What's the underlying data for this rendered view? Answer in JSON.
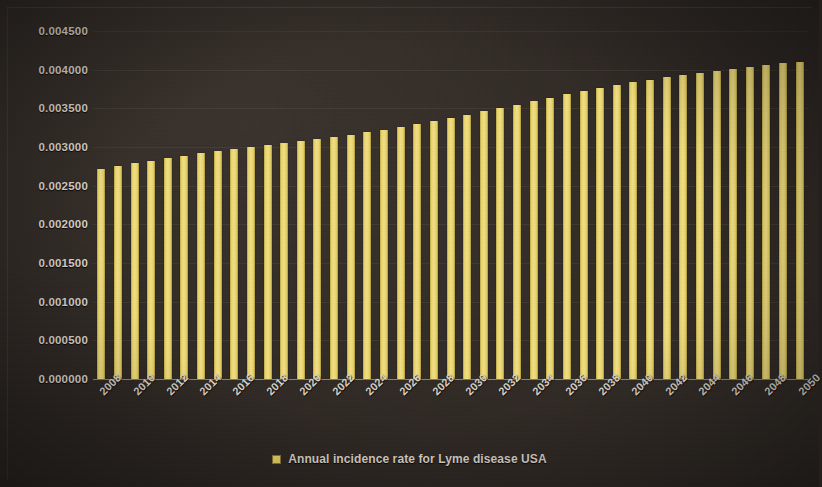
{
  "chart_data": {
    "type": "bar",
    "title": "",
    "subtitle": "",
    "xlabel": "",
    "ylabel": "",
    "grid": true,
    "legend_position": "bottom",
    "ylim": [
      0.0,
      0.0045
    ],
    "ytick_labels": [
      "0.004500",
      "0.004000",
      "0.003500",
      "0.003000",
      "0.002500",
      "0.002000",
      "0.001500",
      "0.001000",
      "0.000500",
      "0.000000"
    ],
    "ytick_values": [
      0.0045,
      0.004,
      0.0035,
      0.003,
      0.0025,
      0.002,
      0.0015,
      0.001,
      0.0005,
      0.0
    ],
    "xtick_labels": [
      "2008",
      "2010",
      "2012",
      "2014",
      "2016",
      "2018",
      "2020",
      "2022",
      "2024",
      "2026",
      "2028",
      "2030",
      "2032",
      "2034",
      "2036",
      "2038",
      "2040",
      "2042",
      "2044",
      "2046",
      "2048",
      "2050"
    ],
    "categories": [
      "2008",
      "2009",
      "2010",
      "2011",
      "2012",
      "2013",
      "2014",
      "2015",
      "2016",
      "2017",
      "2018",
      "2019",
      "2020",
      "2021",
      "2022",
      "2023",
      "2024",
      "2025",
      "2026",
      "2027",
      "2028",
      "2029",
      "2030",
      "2031",
      "2032",
      "2033",
      "2034",
      "2035",
      "2036",
      "2037",
      "2038",
      "2039",
      "2040",
      "2041",
      "2042",
      "2043",
      "2044",
      "2045",
      "2046",
      "2047",
      "2048",
      "2049",
      "2050"
    ],
    "series": [
      {
        "name": "Annual incidence rate for Lyme disease USA",
        "color": "#e9d566",
        "values": [
          0.00272,
          0.002755,
          0.00279,
          0.002825,
          0.00286,
          0.00289,
          0.00292,
          0.00295,
          0.00298,
          0.003005,
          0.00303,
          0.003055,
          0.00308,
          0.003105,
          0.00313,
          0.00316,
          0.00319,
          0.003225,
          0.00326,
          0.0033,
          0.00334,
          0.00338,
          0.00342,
          0.00346,
          0.0035,
          0.003545,
          0.00359,
          0.003635,
          0.00368,
          0.00372,
          0.00376,
          0.0038,
          0.003835,
          0.00387,
          0.0039,
          0.00393,
          0.003955,
          0.00398,
          0.00401,
          0.00404,
          0.004065,
          0.004085,
          0.004105
        ]
      }
    ]
  },
  "legend": {
    "label": "Annual incidence rate for Lyme disease USA",
    "swatch_color": "#e9d566"
  },
  "colors": {
    "background": "#2c2622",
    "bar": "#e9d566",
    "text": "#ded7cd",
    "gridline": "rgba(200,190,178,0.085)",
    "axis": "rgba(215,207,196,0.55)"
  }
}
